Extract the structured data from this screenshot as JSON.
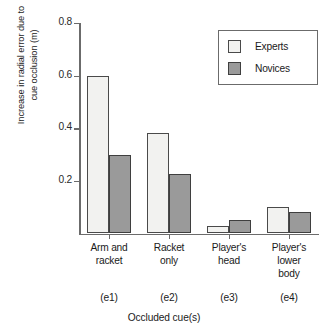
{
  "chart_data": {
    "type": "bar",
    "title": "",
    "xlabel": "Occluded cue(s)",
    "ylabel_line1": "Increase in radial error due to",
    "ylabel_line2": "cue occlusion (m)",
    "categories": [
      "Arm and racket",
      "Racket only",
      "Player's head",
      "Player's lower body"
    ],
    "category_lines": [
      [
        "Arm and",
        "racket"
      ],
      [
        "Racket",
        "only"
      ],
      [
        "Player's",
        "head"
      ],
      [
        "Player's",
        "lower",
        "body"
      ]
    ],
    "category_codes": [
      "(e1)",
      "(e2)",
      "(e3)",
      "(e4)"
    ],
    "series": [
      {
        "name": "Experts",
        "values": [
          0.6,
          0.38,
          0.03,
          0.1
        ],
        "color": "#f2f2f0"
      },
      {
        "name": "Novices",
        "values": [
          0.3,
          0.225,
          0.05,
          0.08
        ],
        "color": "#9a9a9a"
      }
    ],
    "ylim": [
      0,
      0.8
    ],
    "yticks": [
      0.2,
      0.4,
      0.6,
      0.8
    ],
    "ytick_labels": [
      "0.2",
      "0.4",
      "0.6",
      "0.8"
    ],
    "grid": false,
    "legend_position": "top-right",
    "axis_color": "#6b6b6b",
    "bar_edge_color": "#4a4a4a"
  }
}
